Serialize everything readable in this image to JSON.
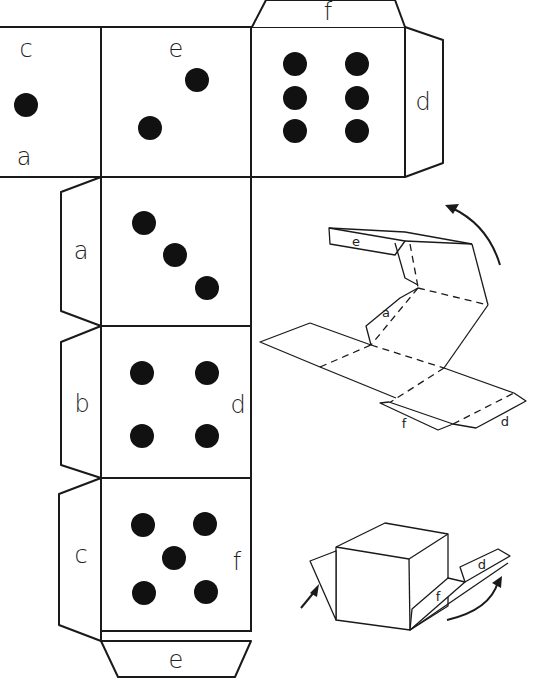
{
  "diagram": {
    "colors": {
      "line": "#1a1a1a",
      "pip": "#111111",
      "background": "#ffffff"
    },
    "net": {
      "faces": [
        {
          "id": "face-one",
          "pips": 1,
          "labels": [
            "c",
            "a"
          ]
        },
        {
          "id": "face-two",
          "pips": 2,
          "labels": [
            "e"
          ]
        },
        {
          "id": "face-six",
          "pips": 6,
          "labels": []
        },
        {
          "id": "face-three",
          "pips": 3,
          "labels": []
        },
        {
          "id": "face-four",
          "pips": 4,
          "labels": [
            "d"
          ]
        },
        {
          "id": "face-five",
          "pips": 5,
          "labels": [
            "f"
          ]
        }
      ],
      "tabs": [
        {
          "id": "tab-top-f",
          "label": "f"
        },
        {
          "id": "tab-right-d",
          "label": "d"
        },
        {
          "id": "tab-left-a",
          "label": "a"
        },
        {
          "id": "tab-left-b",
          "label": "b"
        },
        {
          "id": "tab-left-c",
          "label": "c"
        },
        {
          "id": "tab-bottom-e",
          "label": "e"
        }
      ],
      "face_labels": {
        "one_top": "c",
        "one_bottom": "a",
        "two_top": "e",
        "four_right": "d",
        "five_right": "f"
      }
    },
    "fold_step_1": {
      "labels": {
        "e": "e",
        "a": "a",
        "f": "f",
        "d": "d"
      },
      "arrow": "counterclockwise fold arrow"
    },
    "fold_step_2": {
      "labels": {
        "f": "f",
        "d": "d"
      },
      "arrows": [
        "left push arrow",
        "right curved fold arrow"
      ]
    }
  }
}
